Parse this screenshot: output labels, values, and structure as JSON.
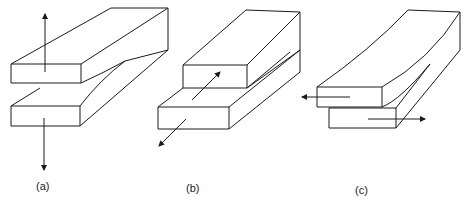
{
  "figure": {
    "panels": [
      {
        "label": "(a)",
        "mode": "opening"
      },
      {
        "label": "(b)",
        "mode": "sliding"
      },
      {
        "label": "(c)",
        "mode": "tearing"
      }
    ]
  },
  "colors": {
    "stroke": "#1a1a1a",
    "background": "#ffffff"
  }
}
